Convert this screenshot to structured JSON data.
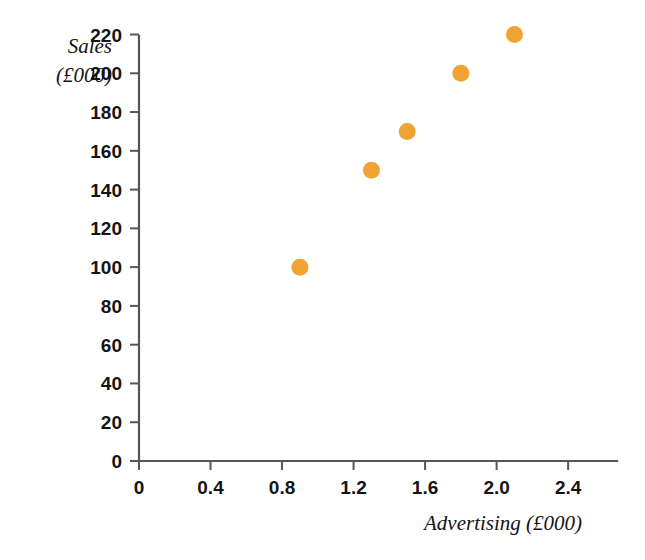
{
  "chart_data": {
    "type": "scatter",
    "title": "",
    "xlabel": "Advertising (£000)",
    "ylabel_line1": "Sales",
    "ylabel_line2": "(£000)",
    "xlim": [
      0,
      2.6
    ],
    "ylim": [
      0,
      230
    ],
    "grid": false,
    "legend": null,
    "marker_color": "#F0A333",
    "axis_color": "#55565a",
    "x": [
      0.9,
      1.3,
      1.5,
      1.8,
      2.1
    ],
    "y": [
      100,
      150,
      170,
      200,
      220
    ],
    "points": [
      {
        "advertising": 0.9,
        "sales": 100
      },
      {
        "advertising": 1.3,
        "sales": 150
      },
      {
        "advertising": 1.5,
        "sales": 170
      },
      {
        "advertising": 1.8,
        "sales": 200
      },
      {
        "advertising": 2.1,
        "sales": 220
      }
    ],
    "xticks": [
      0,
      0.4,
      0.8,
      1.2,
      1.6,
      2.0,
      2.4
    ],
    "xtick_labels": [
      "0",
      "0.4",
      "0.8",
      "1.2",
      "1.6",
      "2.0",
      "2.4"
    ],
    "yticks": [
      0,
      20,
      40,
      60,
      80,
      100,
      120,
      140,
      160,
      180,
      200,
      220
    ],
    "ytick_labels": [
      "0",
      "20",
      "40",
      "60",
      "80",
      "100",
      "120",
      "140",
      "160",
      "180",
      "200",
      "220"
    ]
  }
}
